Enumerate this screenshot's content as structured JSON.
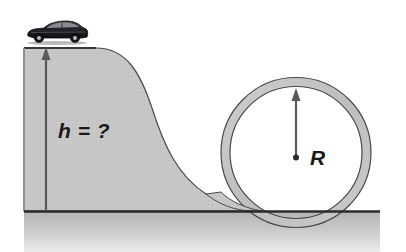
{
  "figure": {
    "type": "physics-diagram",
    "width": 406,
    "height": 252,
    "background_color": "#ffffff"
  },
  "labels": {
    "height_label": "h = ?",
    "radius_label": "R"
  },
  "objects": {
    "car": {
      "name": "car",
      "description": "dark sedan side view facing right",
      "body_color": "#2a2a30",
      "window_color": "#8d8d95",
      "wheel_color": "#141418",
      "x": 26,
      "y": 20,
      "width": 62,
      "height": 27
    },
    "ramp": {
      "name": "ramp",
      "description": "S-curved hill descending from plateau to ground",
      "fill_color": "#c6c6c6",
      "stroke_color": "#4a4a4a",
      "plateau_top_y": 48,
      "plateau_left_x": 24,
      "plateau_right_x": 96
    },
    "loop": {
      "name": "loop",
      "description": "thick circular loop track tangent to ground",
      "fill_color": "#c6c6c6",
      "stroke_color": "#4a4a4a",
      "center_x": 296,
      "center_y": 157,
      "outer_radius": 75,
      "inner_radius": 66,
      "ring_thickness": 9
    },
    "ground": {
      "name": "ground",
      "description": "horizontal ground line with gray shading below",
      "line_color": "#2b2b2b",
      "fill_color": "#bdbdbd",
      "y": 211,
      "left_x": 24,
      "right_x": 380
    }
  },
  "arrows": {
    "height_arrow": {
      "name": "height-arrow",
      "description": "vertical arrow measuring height h from ground to plateau",
      "color": "#5a5a5a",
      "x": 46,
      "y_bottom": 211,
      "y_top": 50
    },
    "radius_arrow": {
      "name": "radius-arrow",
      "description": "vertical arrow from loop center to inner circle top measuring R",
      "color": "#5a5a5a",
      "x": 296,
      "y_bottom": 157,
      "y_top": 93,
      "center_dot_radius": 3
    }
  },
  "colors": {
    "terrain_gray": "#c6c6c6",
    "outline_gray": "#4a4a4a",
    "ground_line": "#2b2b2b",
    "arrow_gray": "#5a5a5a",
    "text_black": "#1a1a1a",
    "white": "#ffffff"
  }
}
